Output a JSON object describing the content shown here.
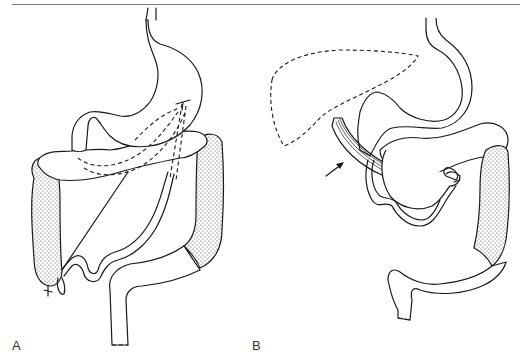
{
  "figure": {
    "header_text_clipped": true,
    "panels": [
      {
        "id": "A",
        "label": "A",
        "depicts": "stomach with transverse colon, ascending and descending colon (stippled), small bowel loop, dashed internal course and straight guide line to cecum"
      },
      {
        "id": "B",
        "label": "B",
        "depicts": "stomach with dashed liver outline, band-like ligament indicated by arrow, small bowel loops, descending colon (stippled)"
      }
    ],
    "annotations": {
      "arrow_in_panel": "B",
      "arrow_label": ""
    },
    "colors": {
      "ink": "#1a1a1a",
      "background": "#ffffff",
      "rule": "#7a7a7a"
    }
  }
}
